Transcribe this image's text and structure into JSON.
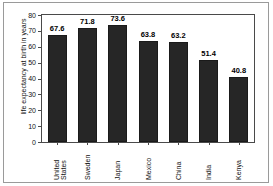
{
  "chart_data": {
    "type": "bar",
    "title": "",
    "xlabel": "",
    "ylabel": "life expectancy at birth in years",
    "ylim": [
      0,
      80
    ],
    "yticks": [
      0,
      10,
      20,
      30,
      40,
      50,
      60,
      70,
      80
    ],
    "grid": false,
    "legend": null,
    "bar_color": "#262626",
    "categories": [
      "United States",
      "Sweden",
      "Japan",
      "Mexico",
      "China",
      "India",
      "Kenya"
    ],
    "category_lines": [
      [
        "United",
        "States"
      ],
      [
        "Sweden",
        ""
      ],
      [
        "Japan",
        ""
      ],
      [
        "Mexico",
        ""
      ],
      [
        "China",
        ""
      ],
      [
        "India",
        ""
      ],
      [
        "Kenya",
        ""
      ]
    ],
    "values": [
      67.6,
      71.8,
      73.6,
      63.8,
      63.2,
      51.4,
      40.8
    ],
    "value_labels": [
      "67.6",
      "71.8",
      "73.6",
      "63.8",
      "63.2",
      "51.4",
      "40.8"
    ]
  }
}
